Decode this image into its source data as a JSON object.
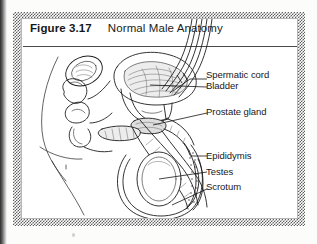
{
  "figure": {
    "number": "Figure 3.17",
    "title": "Normal Male Anatomy"
  },
  "labels": [
    {
      "id": "spermatic-cord",
      "text": "Spermatic cord"
    },
    {
      "id": "bladder",
      "text": "Bladder"
    },
    {
      "id": "prostate-gland",
      "text": "Prostate gland"
    },
    {
      "id": "epididymis",
      "text": "Epididymis"
    },
    {
      "id": "testes",
      "text": "Testes"
    },
    {
      "id": "scrotum",
      "text": "Scrotum"
    }
  ],
  "colors": {
    "ink": "#1d1d1d",
    "frame_pattern": "#5d5d5d",
    "page": "#fcfcfb",
    "rule": "#4a4a4a"
  }
}
